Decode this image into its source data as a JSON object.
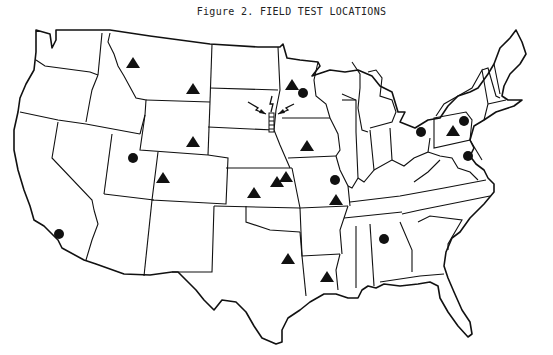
{
  "figure": {
    "title": "Figure 2.  FIELD TEST LOCATIONS"
  },
  "map": {
    "region": "Contiguous United States",
    "line_color": "#111111",
    "background": "#ffffff"
  },
  "legend_symbols": {
    "triangle": "triangle-marker",
    "circle": "circle-marker",
    "tower": "radio-tower-icon"
  },
  "markers": {
    "triangles": [
      {
        "x": 133,
        "y": 63,
        "area": "Montana (west)"
      },
      {
        "x": 193,
        "y": 89,
        "area": "Montana (east)"
      },
      {
        "x": 193,
        "y": 142,
        "area": "Wyoming"
      },
      {
        "x": 163,
        "y": 178,
        "area": "Colorado"
      },
      {
        "x": 254,
        "y": 193,
        "area": "Kansas (west)"
      },
      {
        "x": 277,
        "y": 182,
        "area": "Kansas (east)"
      },
      {
        "x": 286,
        "y": 177,
        "area": "Kansas (east)"
      },
      {
        "x": 292,
        "y": 85,
        "area": "Minnesota"
      },
      {
        "x": 307,
        "y": 146,
        "area": "Iowa"
      },
      {
        "x": 336,
        "y": 200,
        "area": "Missouri"
      },
      {
        "x": 288,
        "y": 259,
        "area": "Texas (north)"
      },
      {
        "x": 327,
        "y": 277,
        "area": "Louisiana"
      },
      {
        "x": 453,
        "y": 131,
        "area": "Pennsylvania"
      }
    ],
    "circles": [
      {
        "x": 133,
        "y": 158,
        "area": "Utah"
      },
      {
        "x": 59,
        "y": 234,
        "area": "Southern California"
      },
      {
        "x": 303,
        "y": 93,
        "area": "Minnesota"
      },
      {
        "x": 335,
        "y": 180,
        "area": "Missouri / Illinois"
      },
      {
        "x": 384,
        "y": 239,
        "area": "Alabama"
      },
      {
        "x": 421,
        "y": 132,
        "area": "Ohio"
      },
      {
        "x": 464,
        "y": 121,
        "area": "New Jersey / New York"
      },
      {
        "x": 468,
        "y": 156,
        "area": "Virginia"
      }
    ],
    "tower": {
      "x": 272,
      "y": 118,
      "area": "South Dakota (east)"
    }
  }
}
